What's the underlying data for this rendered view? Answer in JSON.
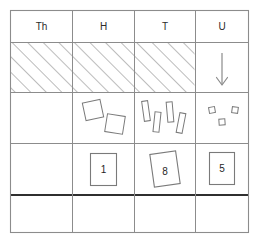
{
  "worksheet": {
    "type": "place-value-chart",
    "title": "Place value chart",
    "columns": [
      {
        "key": "Th",
        "label": "Th",
        "name": "thousands"
      },
      {
        "key": "H",
        "label": "H",
        "name": "hundreds"
      },
      {
        "key": "T",
        "label": "T",
        "name": "tens"
      },
      {
        "key": "U",
        "label": "U",
        "name": "units"
      }
    ],
    "rows": [
      {
        "name": "header-row",
        "kind": "header"
      },
      {
        "name": "hatched-row",
        "kind": "hatched"
      },
      {
        "name": "blocks-row",
        "kind": "blocks"
      },
      {
        "name": "digits-row",
        "kind": "digits"
      },
      {
        "name": "answer-row",
        "kind": "blank"
      }
    ],
    "hatched_columns": [
      "Th",
      "H",
      "T"
    ],
    "arrow": {
      "column": "U",
      "direction": "down",
      "label": "down-arrow"
    },
    "blocks": {
      "Th": {
        "count": 0,
        "shape": "none"
      },
      "H": {
        "count": 2,
        "shape": "flat-square"
      },
      "T": {
        "count": 4,
        "shape": "rod"
      },
      "U": {
        "count": 3,
        "shape": "unit-cube"
      }
    },
    "digits": {
      "Th": "",
      "H": "1",
      "T": "8",
      "U": "5"
    },
    "answer_row_values": {
      "Th": "",
      "H": "",
      "T": "",
      "U": ""
    },
    "colors": {
      "grid": "#8c8c8c",
      "grid_thick": "#2f2f2f",
      "hatch": "#7a7a7a",
      "text": "#2b2b2b",
      "shape_stroke": "#7a7a7a",
      "background": "#ffffff"
    }
  }
}
